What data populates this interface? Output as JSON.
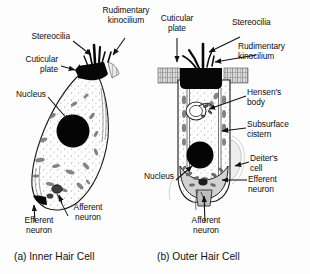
{
  "figure": {
    "title_hidden": "Cochlear hair cell anatomy comparison",
    "background_color": "#fdfdfd",
    "ink_color": "#111111"
  },
  "panel_a": {
    "caption": "(a) Inner Hair Cell",
    "labels": {
      "stereocilia": "Stereocilia",
      "rudimentary_kinocilium": "Rudimentary\nkinocilium",
      "cuticular_plate": "Cuticular\nplate",
      "nucleus": "Nucleus",
      "efferent_neuron": "Efferent\nneuron",
      "afferent_neuron": "Afferent\nneuron"
    }
  },
  "panel_b": {
    "caption": "(b) Outer Hair Cell",
    "labels": {
      "cuticular_plate": "Cuticular\nplate",
      "stereocilia": "Stereocilia",
      "rudimentary_kinocilium": "Rudimentary\nkinocilium",
      "hensens_body": "Hensen's\nbody",
      "subsurface_cistern": "Subsurface\ncistern",
      "deiters_cell": "Deiter's\ncell",
      "efferent_neuron": "Efferent\nneuron",
      "nucleus": "Nucleus",
      "afferent_neuron": "Afferent\nneuron"
    }
  }
}
